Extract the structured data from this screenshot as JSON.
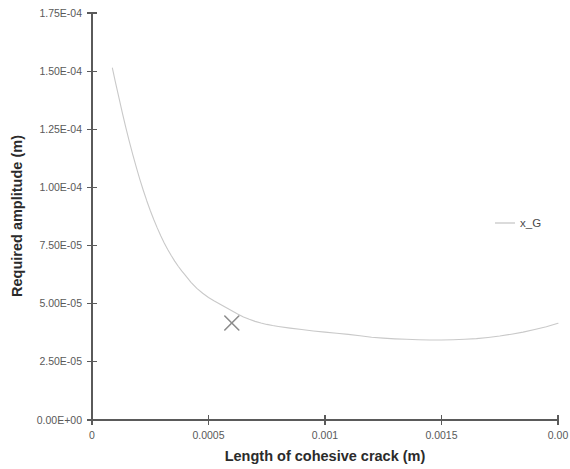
{
  "chart_data": {
    "type": "line",
    "title": "",
    "xlabel": "Length of cohesive crack (m)",
    "ylabel": "Required amplitude (m)",
    "xlim": [
      0,
      0.002
    ],
    "ylim": [
      0,
      0.000175
    ],
    "grid": false,
    "legend_position": "right",
    "x_tick_labels": [
      "0",
      "0.0005",
      "0.001",
      "0.0015",
      "0.00"
    ],
    "x_tick_values": [
      0,
      0.0005,
      0.001,
      0.0015,
      0.002
    ],
    "y_tick_labels": [
      "0.00E+00",
      "2.50E-05",
      "5.00E-05",
      "7.50E-05",
      "1.00E-04",
      "1.25E-04",
      "1.50E-04",
      "1.75E-04"
    ],
    "y_tick_values": [
      0,
      2.5e-05,
      5e-05,
      7.5e-05,
      0.0001,
      0.000125,
      0.00015,
      0.000175
    ],
    "series": [
      {
        "name": "x_G",
        "color": "#c9c9c9",
        "x": [
          8.75e-05,
          0.0001,
          0.000115,
          0.00013,
          0.000145,
          0.00016,
          0.000175,
          0.00019,
          0.000205,
          0.00022,
          0.000235,
          0.00025,
          0.000265,
          0.00028,
          0.000295,
          0.00031,
          0.000325,
          0.00034,
          0.000355,
          0.00037,
          0.000385,
          0.0004,
          0.000425,
          0.00045,
          0.000475,
          0.0005,
          0.000525,
          0.00055,
          0.000575,
          0.0006,
          0.000625,
          0.00065,
          0.000675,
          0.0007,
          0.000725,
          0.00075,
          0.000775,
          0.0008,
          0.00085,
          0.0009,
          0.00095,
          0.001,
          0.00105,
          0.0011,
          0.00115,
          0.0012,
          0.00125,
          0.0013,
          0.00135,
          0.0014,
          0.00145,
          0.0015,
          0.00155,
          0.0016,
          0.00165,
          0.0017,
          0.00175,
          0.0018,
          0.00185,
          0.0019,
          0.00195,
          0.002
        ],
        "y": [
          0.0001513,
          0.0001455,
          0.0001388,
          0.0001322,
          0.0001258,
          0.0001198,
          0.0001141,
          0.0001087,
          0.0001036,
          9.88e-05,
          9.43e-05,
          9.01e-05,
          8.62e-05,
          8.26e-05,
          7.92e-05,
          7.61e-05,
          7.33e-05,
          7.07e-05,
          6.83e-05,
          6.61e-05,
          6.41e-05,
          6.23e-05,
          5.92e-05,
          5.66e-05,
          5.45e-05,
          5.27e-05,
          5.12e-05,
          4.98e-05,
          4.84e-05,
          4.7e-05,
          4.56e-05,
          4.43e-05,
          4.33e-05,
          4.24e-05,
          4.17e-05,
          4.11e-05,
          4.06e-05,
          4.02e-05,
          3.95e-05,
          3.89e-05,
          3.83e-05,
          3.78e-05,
          3.73e-05,
          3.68e-05,
          3.62e-05,
          3.56e-05,
          3.52e-05,
          3.49e-05,
          3.47e-05,
          3.45e-05,
          3.44e-05,
          3.44e-05,
          3.45e-05,
          3.47e-05,
          3.5e-05,
          3.55e-05,
          3.61e-05,
          3.69e-05,
          3.78e-05,
          3.89e-05,
          4.01e-05,
          4.16e-05
        ]
      }
    ],
    "markers": [
      {
        "name": "design-point-marker",
        "symbol": "x",
        "x": 0.0006,
        "y": 4.17e-05,
        "color": "#8c8c8c"
      }
    ],
    "legend": [
      {
        "label": "x_G",
        "color": "#c9c9c9"
      }
    ]
  }
}
